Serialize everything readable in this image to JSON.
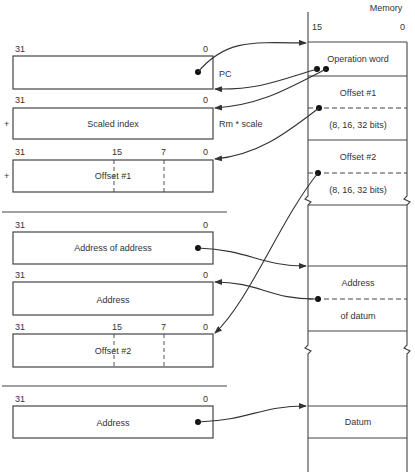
{
  "memory": {
    "title": "Memory",
    "bit_high": "15",
    "bit_low": "0",
    "cells": [
      {
        "id": "operation-word",
        "label": "Operation word"
      },
      {
        "id": "offset1",
        "label_top": "Offset #1",
        "label_bottom": "(8, 16, 32 bits)"
      },
      {
        "id": "offset2",
        "label_top": "Offset #2",
        "label_bottom": "(8, 16, 32 bits)"
      },
      {
        "id": "address-of-datum",
        "label_top": "Address",
        "label_bottom": "of datum"
      },
      {
        "id": "datum",
        "label": "Datum"
      }
    ]
  },
  "registers": {
    "pc": {
      "bit_high": "31",
      "bit_low": "0",
      "side_label": "PC"
    },
    "scaled_index": {
      "bit_high": "31",
      "bit_low": "0",
      "label": "Scaled index",
      "side_label": "Rm * scale",
      "prefix": "+"
    },
    "offset1": {
      "bit_high": "31",
      "bit_mid1": "15",
      "bit_mid2": "7",
      "bit_low": "0",
      "label": "Offset #1",
      "prefix": "+"
    },
    "address_of_address": {
      "bit_high": "31",
      "bit_low": "0",
      "label": "Address of address"
    },
    "address": {
      "bit_high": "31",
      "bit_low": "0",
      "label": "Address"
    },
    "offset2": {
      "bit_high": "31",
      "bit_mid1": "15",
      "bit_mid2": "7",
      "bit_low": "0",
      "label": "Offset #2"
    },
    "final_address": {
      "bit_high": "31",
      "bit_low": "0",
      "label": "Address"
    }
  }
}
